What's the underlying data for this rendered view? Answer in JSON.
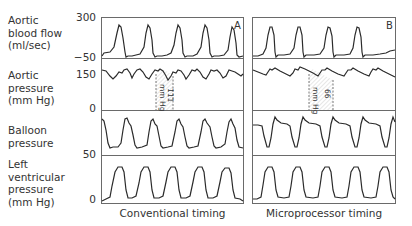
{
  "figure": {
    "row_labels": [
      {
        "lines": [
          "Aortic",
          "blood flow",
          "(ml/sec)"
        ]
      },
      {
        "lines": [
          "Aortic",
          "pressure",
          "(mm Hg)"
        ]
      },
      {
        "lines": [
          "Balloon",
          "pressure"
        ]
      },
      {
        "lines": [
          "Left",
          "ventricular",
          "pressure",
          "(mm Hg)"
        ]
      }
    ],
    "ticks": {
      "flow_top": "300",
      "flow_bottom": "−50",
      "pressure_top": "150",
      "pressure_bottom": "0",
      "lv_top": "50",
      "lv_bottom": "0"
    },
    "panels": [
      {
        "letter": "A",
        "caption": "Conventional timing",
        "annotation_value": "111",
        "annotation_unit": "mm Hg"
      },
      {
        "letter": "B",
        "caption": "Microprocessor timing",
        "annotation_value": "66",
        "annotation_unit": "mm Hg"
      }
    ],
    "colors": {
      "line": "#2b2b2b",
      "frame": "#6a6a6a",
      "hatch": "#777777"
    }
  }
}
